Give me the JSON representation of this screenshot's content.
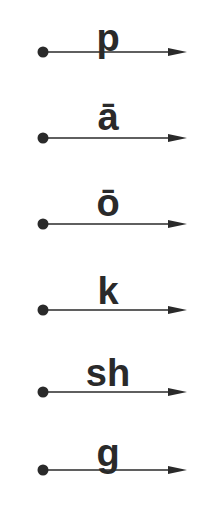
{
  "diagram": {
    "ink_color": "#2a2a2a",
    "rows": [
      {
        "label": "p"
      },
      {
        "label": "ā"
      },
      {
        "label": "ō"
      },
      {
        "label": "k"
      },
      {
        "label": "sh"
      },
      {
        "label": "g"
      }
    ]
  }
}
